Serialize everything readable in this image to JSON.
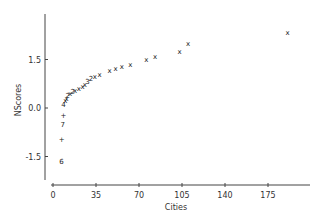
{
  "chart_data": {
    "type": "scatter",
    "title": "",
    "xlabel": "Cities",
    "ylabel": "NScores",
    "xlim": [
      0,
      196
    ],
    "ylim": [
      -2.3,
      2.6
    ],
    "grid": false,
    "legend": null,
    "x_ticks": [
      0,
      35,
      70,
      105,
      140,
      175
    ],
    "x_tick_labels": [
      "0",
      "35",
      "70",
      "105",
      "140",
      "175"
    ],
    "y_ticks": [
      1.5,
      0.0,
      -1.5
    ],
    "y_tick_labels": [
      "1.5",
      "0.0",
      "-1.5"
    ],
    "points": [
      {
        "x": 7,
        "y": -1.65,
        "marker": "6"
      },
      {
        "x": 7,
        "y": -0.98,
        "marker": "+"
      },
      {
        "x": 8,
        "y": -0.52,
        "marker": "7"
      },
      {
        "x": 8.5,
        "y": -0.22,
        "marker": "+"
      },
      {
        "x": 8.5,
        "y": 0.12,
        "marker": "4"
      },
      {
        "x": 10,
        "y": 0.22,
        "marker": "x"
      },
      {
        "x": 11,
        "y": 0.3,
        "marker": "x"
      },
      {
        "x": 12,
        "y": 0.38,
        "marker": "2"
      },
      {
        "x": 14,
        "y": 0.45,
        "marker": "x"
      },
      {
        "x": 16,
        "y": 0.5,
        "marker": "2"
      },
      {
        "x": 18,
        "y": 0.55,
        "marker": "x"
      },
      {
        "x": 21,
        "y": 0.6,
        "marker": "x"
      },
      {
        "x": 24,
        "y": 0.66,
        "marker": "x"
      },
      {
        "x": 26,
        "y": 0.74,
        "marker": "x"
      },
      {
        "x": 28,
        "y": 0.82,
        "marker": "3"
      },
      {
        "x": 31,
        "y": 0.9,
        "marker": "2"
      },
      {
        "x": 34,
        "y": 0.98,
        "marker": "x"
      },
      {
        "x": 38,
        "y": 1.04,
        "marker": "x"
      },
      {
        "x": 46,
        "y": 1.15,
        "marker": "x"
      },
      {
        "x": 51,
        "y": 1.22,
        "marker": "x"
      },
      {
        "x": 56,
        "y": 1.29,
        "marker": "x"
      },
      {
        "x": 63,
        "y": 1.36,
        "marker": "x"
      },
      {
        "x": 76,
        "y": 1.5,
        "marker": "x"
      },
      {
        "x": 83,
        "y": 1.6,
        "marker": "x"
      },
      {
        "x": 103,
        "y": 1.76,
        "marker": "x"
      },
      {
        "x": 110,
        "y": 1.99,
        "marker": "x"
      },
      {
        "x": 191,
        "y": 2.35,
        "marker": "x"
      }
    ]
  },
  "axes": {
    "xlabel": "Cities",
    "ylabel": "NScores"
  }
}
